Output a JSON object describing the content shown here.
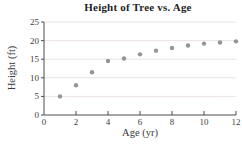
{
  "chart_data": {
    "type": "scatter",
    "title": "Height of Tree vs. Age",
    "xlabel": "Age (yr)",
    "ylabel": "Height (ft)",
    "x": [
      1,
      2,
      3,
      4,
      5,
      6,
      7,
      8,
      9,
      10,
      11,
      12
    ],
    "y": [
      5,
      8,
      11.5,
      14.5,
      15.2,
      16.3,
      17.3,
      18.0,
      18.7,
      19.2,
      19.5,
      19.8
    ],
    "xlim": [
      0,
      12
    ],
    "ylim": [
      0,
      25
    ],
    "xticks": [
      0,
      2,
      4,
      6,
      8,
      10,
      12
    ],
    "yticks": [
      0,
      5,
      10,
      15,
      20,
      25
    ],
    "grid": "horizontal",
    "legend": "none",
    "colors": {
      "point": "#959595",
      "axis": "#4d4d4d",
      "grid": "#ece2e2",
      "tick_text": "#3d3d3d",
      "title": "#1f1f1f",
      "background": "#ffffff"
    }
  }
}
